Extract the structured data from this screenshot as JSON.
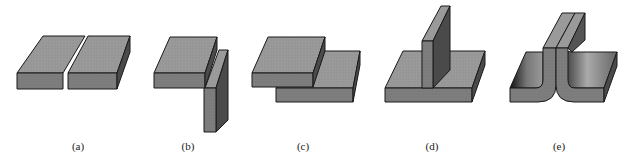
{
  "figure": {
    "panels": [
      {
        "id": "a",
        "label": "(a)",
        "depiction": "two plates butted edge to edge"
      },
      {
        "id": "b",
        "label": "(b)",
        "depiction": "horizontal plate meeting vertical plate at corner"
      },
      {
        "id": "c",
        "label": "(c)",
        "depiction": "two plates overlapping (lap)"
      },
      {
        "id": "d",
        "label": "(d)",
        "depiction": "vertical plate standing on horizontal plate (tee)"
      },
      {
        "id": "e",
        "label": "(e)",
        "depiction": "two flanged plates joined back to back (edge)"
      }
    ]
  },
  "colors": {
    "top_face": "#9a9a9a",
    "front_face": "#7e7e7e",
    "side_face": "#4a4a4a",
    "outline": "#1a1a1a",
    "background": "#ffffff"
  }
}
